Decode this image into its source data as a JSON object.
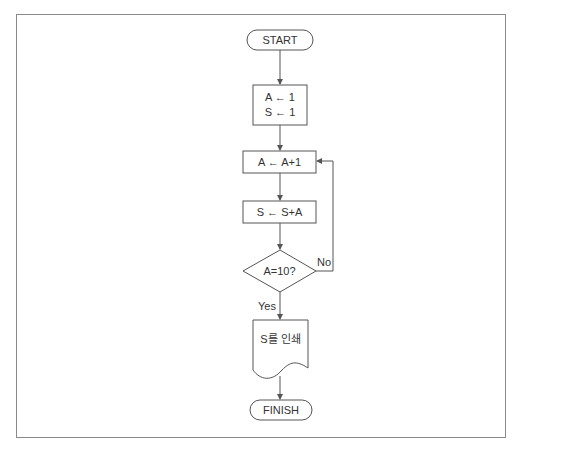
{
  "diagram": {
    "type": "flowchart",
    "nodes": {
      "start": {
        "shape": "terminator",
        "label": "START"
      },
      "init": {
        "shape": "process",
        "lines": [
          "A ← 1",
          "S ← 1"
        ]
      },
      "incA": {
        "shape": "process",
        "label": "A ← A+1"
      },
      "addS": {
        "shape": "process",
        "label": "S ← S+A"
      },
      "decision": {
        "shape": "decision",
        "label": "A=10?"
      },
      "print": {
        "shape": "document",
        "label": "S를 인쇄"
      },
      "finish": {
        "shape": "terminator",
        "label": "FINISH"
      }
    },
    "edges": {
      "yes_label": "Yes",
      "no_label": "No"
    },
    "colors": {
      "stroke": "#555555",
      "frame": "#8a8a8a"
    }
  }
}
